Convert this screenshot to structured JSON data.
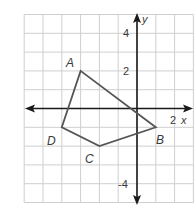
{
  "figure": {
    "type": "coordinate-plane-polygon",
    "grid": {
      "x_min": -6,
      "x_max": 3,
      "y_min": -5,
      "y_max": 5,
      "cell_px": 18.8,
      "origin_px": [
        137,
        108.5
      ],
      "grid_color": "#cfcfcf",
      "axis_color": "#1a1a1a",
      "polygon_color": "#555555"
    },
    "axes": {
      "x_label": "x",
      "y_label": "y",
      "ticks": [
        {
          "text": "4",
          "axis": "y",
          "value": 4
        },
        {
          "text": "2",
          "axis": "y",
          "value": 2
        },
        {
          "text": "-4",
          "axis": "y",
          "value": -4
        },
        {
          "text": "2",
          "axis": "x",
          "value": 2
        }
      ]
    },
    "polygon": {
      "vertices": [
        {
          "label": "A",
          "x": -3,
          "y": 2
        },
        {
          "label": "B",
          "x": 1,
          "y": -1
        },
        {
          "label": "C",
          "x": -2,
          "y": -2
        },
        {
          "label": "D",
          "x": -4,
          "y": -1
        }
      ]
    }
  }
}
